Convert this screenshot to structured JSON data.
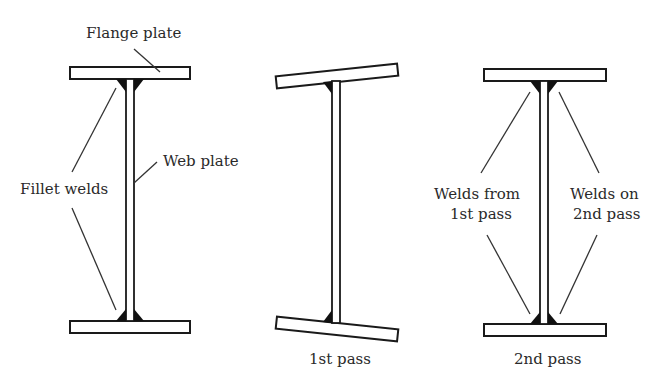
{
  "figure": {
    "panels": [
      {
        "id": "assembly",
        "labels": {
          "flange": "Flange plate",
          "fillet": "Fillet welds",
          "web": "Web plate"
        }
      },
      {
        "id": "first-pass",
        "caption": "1st pass"
      },
      {
        "id": "second-pass",
        "caption": "2nd pass",
        "labels": {
          "welds_first": [
            "Welds from",
            "1st pass"
          ],
          "welds_second": [
            "Welds on",
            "2nd pass"
          ]
        }
      }
    ]
  },
  "colors": {
    "line": "#1a1a1a",
    "weld": "#111111",
    "text": "#2a2a2a",
    "background": "#ffffff"
  }
}
